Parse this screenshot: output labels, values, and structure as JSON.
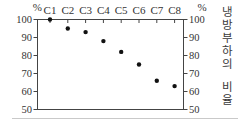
{
  "figure": {
    "left_axis_unit": "%",
    "right_axis_unit": "%",
    "right_vertical_label": "냉방부하의 비율",
    "right_vertical_chars": [
      "냉",
      "방",
      "부",
      "하",
      "의",
      "",
      "비",
      "율"
    ]
  },
  "chart_data": {
    "type": "scatter",
    "title": "",
    "xlabel": "",
    "ylabel": "냉방부하의 비율",
    "categories": [
      "C1",
      "C2",
      "C3",
      "C4",
      "C5",
      "C6",
      "C7",
      "C8"
    ],
    "values": [
      100,
      95,
      93,
      88,
      82,
      75,
      66,
      63
    ],
    "ylim": [
      50,
      100
    ],
    "yticks": [
      100,
      90,
      80,
      70,
      60,
      50
    ],
    "y_unit": "%",
    "legend": "none",
    "grid": "off",
    "marker": "dot",
    "colors": {
      "marker": "#111111",
      "axis": "#444444",
      "text": "#333333",
      "background": "#ffffff"
    }
  }
}
